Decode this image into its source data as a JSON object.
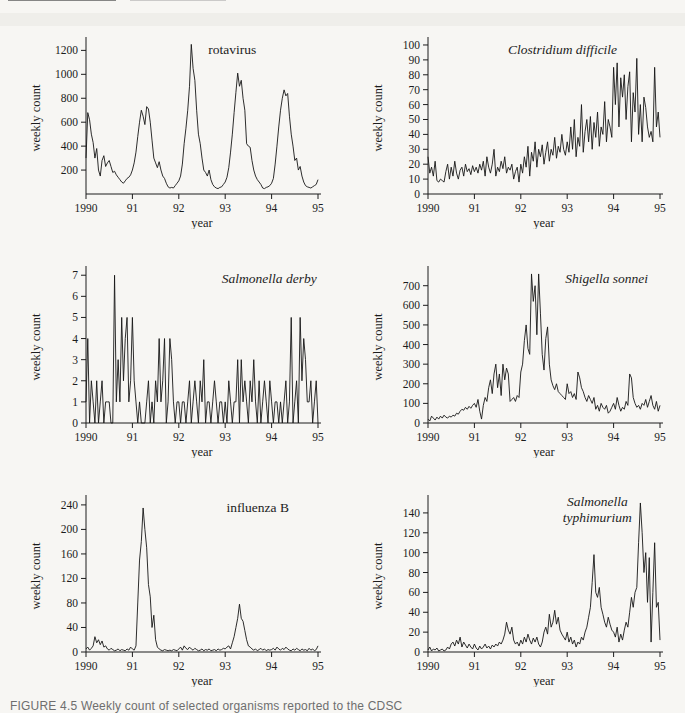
{
  "page": {
    "caption": "FIGURE 4.5  Weekly count of selected organisms reported to the CDSC"
  },
  "chart_data": [
    {
      "type": "line",
      "title": "rotavirus",
      "title_lines": [
        "rotavirus"
      ],
      "title_italic": false,
      "title_x": 0.63,
      "xlabel": "year",
      "ylabel": "weekly count",
      "x_tick_labels": [
        "1990",
        "91",
        "92",
        "93",
        "94",
        "95"
      ],
      "xlim": [
        1990,
        1995
      ],
      "y_ticks": [
        200,
        400,
        600,
        800,
        1000,
        1200
      ],
      "ylim": [
        0,
        1270
      ],
      "values": [
        300,
        680,
        620,
        500,
        430,
        300,
        380,
        200,
        150,
        280,
        320,
        230,
        260,
        280,
        230,
        180,
        190,
        160,
        140,
        120,
        100,
        90,
        110,
        130,
        140,
        160,
        200,
        260,
        350,
        480,
        600,
        700,
        650,
        580,
        730,
        710,
        600,
        450,
        300,
        260,
        220,
        270,
        200,
        150,
        130,
        90,
        60,
        50,
        55,
        50,
        70,
        90,
        110,
        150,
        250,
        420,
        550,
        700,
        900,
        1250,
        1050,
        950,
        700,
        500,
        420,
        300,
        200,
        180,
        150,
        200,
        120,
        80,
        60,
        50,
        45,
        55,
        60,
        80,
        100,
        140,
        220,
        350,
        500,
        680,
        850,
        1010,
        900,
        950,
        800,
        700,
        420,
        400,
        390,
        280,
        200,
        150,
        120,
        100,
        80,
        50,
        45,
        55,
        60,
        70,
        90,
        130,
        250,
        400,
        560,
        700,
        800,
        870,
        820,
        840,
        650,
        500,
        400,
        280,
        300,
        200,
        230,
        150,
        100,
        70,
        60,
        55,
        50,
        60,
        70,
        80,
        120
      ]
    },
    {
      "type": "line",
      "title": "Clostridium difficile",
      "title_lines": [
        "Clostridium difficile"
      ],
      "title_italic": true,
      "title_x": 0.58,
      "xlabel": "year",
      "ylabel": "weekly count",
      "x_tick_labels": [
        "1990",
        "91",
        "92",
        "93",
        "94",
        "95"
      ],
      "xlim": [
        1990,
        1995
      ],
      "y_ticks": [
        0,
        10,
        20,
        30,
        40,
        50,
        60,
        70,
        80,
        90,
        100
      ],
      "ylim": [
        0,
        102
      ],
      "values": [
        25,
        14,
        18,
        12,
        22,
        9,
        8,
        10,
        9,
        8,
        15,
        20,
        10,
        18,
        12,
        22,
        14,
        10,
        16,
        18,
        12,
        20,
        15,
        17,
        13,
        19,
        15,
        18,
        14,
        20,
        16,
        22,
        12,
        25,
        18,
        14,
        20,
        30,
        12,
        18,
        15,
        22,
        17,
        25,
        14,
        18,
        16,
        20,
        10,
        15,
        18,
        8,
        20,
        14,
        25,
        18,
        32,
        12,
        28,
        22,
        35,
        18,
        30,
        25,
        33,
        20,
        28,
        35,
        22,
        30,
        26,
        38,
        24,
        32,
        28,
        40,
        30,
        26,
        35,
        28,
        45,
        30,
        50,
        25,
        38,
        32,
        60,
        28,
        42,
        50,
        35,
        52,
        30,
        48,
        38,
        55,
        32,
        45,
        40,
        62,
        35,
        50,
        45,
        38,
        85,
        60,
        88,
        45,
        78,
        65,
        80,
        50,
        72,
        82,
        35,
        68,
        55,
        91,
        40,
        60,
        35,
        65,
        58,
        45,
        38,
        42,
        35,
        85,
        45,
        55,
        38
      ]
    },
    {
      "type": "line",
      "title": "Salmonella derby",
      "title_lines": [
        "Salmonella derby"
      ],
      "title_italic": true,
      "title_x": 0.79,
      "xlabel": "year",
      "ylabel": "weekly count",
      "x_tick_labels": [
        "1990",
        "91",
        "92",
        "93",
        "94",
        "95"
      ],
      "xlim": [
        1990,
        1995
      ],
      "y_ticks": [
        0,
        1,
        2,
        3,
        4,
        5,
        6,
        7
      ],
      "ylim": [
        0,
        7.2
      ],
      "values": [
        1,
        4,
        0,
        2,
        1,
        0,
        2,
        0,
        1,
        2,
        0,
        1,
        1,
        1,
        0,
        0,
        7,
        1,
        3,
        1,
        5,
        2,
        4,
        5,
        1,
        2,
        5,
        2,
        1,
        0,
        1,
        0,
        0,
        0,
        1,
        2,
        0,
        1,
        0,
        2,
        1,
        4,
        1,
        2,
        4,
        0,
        1,
        4,
        3,
        1,
        0,
        1,
        1,
        0,
        1,
        1,
        0,
        1,
        2,
        0,
        1,
        2,
        1,
        0,
        2,
        1,
        3,
        0,
        1,
        1,
        0,
        1,
        2,
        1,
        0,
        1,
        1,
        0,
        1,
        0,
        2,
        1,
        0,
        1,
        1,
        3,
        0,
        3,
        1,
        2,
        1,
        0,
        2,
        1,
        3,
        1,
        0,
        2,
        0,
        1,
        2,
        1,
        0,
        2,
        1,
        0,
        1,
        1,
        0,
        1,
        0,
        1,
        2,
        0,
        1,
        5,
        0,
        1,
        2,
        0,
        5,
        2,
        4,
        3,
        1,
        1,
        2,
        0,
        1,
        2,
        0
      ]
    },
    {
      "type": "line",
      "title": "Shigella sonnei",
      "title_lines": [
        "Shigella sonnei"
      ],
      "title_italic": true,
      "title_x": 0.77,
      "xlabel": "year",
      "ylabel": "weekly count",
      "x_tick_labels": [
        "1990",
        "91",
        "92",
        "93",
        "94",
        "95"
      ],
      "xlim": [
        1990,
        1995
      ],
      "y_ticks": [
        0,
        100,
        200,
        300,
        400,
        500,
        600,
        700
      ],
      "ylim": [
        0,
        775
      ],
      "values": [
        20,
        10,
        35,
        25,
        15,
        30,
        20,
        35,
        25,
        40,
        30,
        25,
        35,
        30,
        40,
        35,
        50,
        45,
        60,
        70,
        65,
        80,
        70,
        85,
        75,
        90,
        100,
        80,
        120,
        60,
        20,
        90,
        130,
        110,
        180,
        220,
        150,
        250,
        300,
        180,
        250,
        140,
        300,
        220,
        280,
        250,
        110,
        120,
        130,
        110,
        140,
        130,
        260,
        300,
        420,
        500,
        380,
        350,
        760,
        620,
        700,
        450,
        760,
        560,
        350,
        270,
        430,
        490,
        300,
        220,
        190,
        170,
        200,
        160,
        150,
        140,
        130,
        120,
        200,
        150,
        160,
        130,
        150,
        120,
        260,
        230,
        180,
        160,
        130,
        110,
        140,
        120,
        100,
        130,
        70,
        90,
        60,
        100,
        80,
        70,
        90,
        50,
        60,
        80,
        100,
        70,
        130,
        90,
        60,
        80,
        70,
        110,
        90,
        250,
        230,
        130,
        100,
        80,
        90,
        70,
        100,
        90,
        120,
        80,
        110,
        140,
        90,
        70,
        110,
        60,
        90
      ]
    },
    {
      "type": "line",
      "title": "influenza B",
      "title_lines": [
        "influenza B"
      ],
      "title_italic": false,
      "title_x": 0.74,
      "xlabel": "year",
      "ylabel": "weekly count",
      "x_tick_labels": [
        "1990",
        "91",
        "92",
        "93",
        "94",
        "95"
      ],
      "xlim": [
        1990,
        1995
      ],
      "y_ticks": [
        0,
        40,
        80,
        120,
        160,
        200,
        240
      ],
      "ylim": [
        0,
        248
      ],
      "values": [
        5,
        8,
        3,
        6,
        10,
        25,
        15,
        20,
        12,
        18,
        8,
        10,
        5,
        3,
        6,
        4,
        2,
        3,
        5,
        2,
        4,
        3,
        2,
        5,
        3,
        8,
        5,
        3,
        10,
        80,
        150,
        180,
        235,
        200,
        170,
        110,
        90,
        40,
        60,
        20,
        8,
        5,
        3,
        2,
        4,
        3,
        2,
        3,
        2,
        4,
        3,
        2,
        5,
        8,
        3,
        10,
        6,
        4,
        8,
        5,
        3,
        6,
        4,
        2,
        3,
        5,
        2,
        4,
        3,
        5,
        2,
        3,
        4,
        2,
        5,
        3,
        4,
        6,
        5,
        8,
        10,
        5,
        15,
        25,
        40,
        55,
        78,
        55,
        50,
        35,
        20,
        10,
        8,
        5,
        3,
        5,
        2,
        4,
        6,
        3,
        5,
        2,
        4,
        3,
        4,
        6,
        3,
        8,
        5,
        3,
        6,
        4,
        8,
        5,
        3,
        2,
        5,
        3,
        6,
        4,
        2,
        5,
        3,
        4,
        2,
        6,
        3,
        5,
        2,
        4,
        10
      ]
    },
    {
      "type": "line",
      "title": "Salmonella typhimurium",
      "title_lines": [
        "Salmonella",
        "typhimurium"
      ],
      "title_italic": true,
      "title_x": 0.73,
      "xlabel": "year",
      "ylabel": "weekly count",
      "x_tick_labels": [
        "1990",
        "91",
        "92",
        "93",
        "94",
        "95"
      ],
      "xlim": [
        1990,
        1995
      ],
      "y_ticks": [
        0,
        20,
        40,
        60,
        80,
        100,
        120,
        140
      ],
      "ylim": [
        0,
        153
      ],
      "values": [
        2,
        5,
        1,
        3,
        2,
        4,
        1,
        2,
        3,
        1,
        2,
        5,
        3,
        8,
        10,
        6,
        12,
        8,
        15,
        5,
        10,
        7,
        4,
        8,
        5,
        3,
        8,
        4,
        2,
        6,
        3,
        5,
        8,
        4,
        6,
        3,
        7,
        5,
        8,
        6,
        10,
        8,
        12,
        18,
        30,
        22,
        18,
        25,
        12,
        8,
        10,
        6,
        12,
        8,
        15,
        10,
        18,
        12,
        8,
        14,
        10,
        15,
        8,
        5,
        10,
        20,
        25,
        18,
        38,
        25,
        30,
        42,
        28,
        35,
        22,
        18,
        15,
        12,
        20,
        10,
        15,
        8,
        12,
        5,
        10,
        8,
        15,
        12,
        20,
        25,
        35,
        45,
        70,
        98,
        60,
        55,
        65,
        45,
        38,
        30,
        25,
        35,
        28,
        22,
        20,
        15,
        25,
        10,
        18,
        12,
        22,
        30,
        25,
        40,
        55,
        45,
        60,
        65,
        110,
        150,
        120,
        80,
        100,
        50,
        95,
        10,
        60,
        110,
        45,
        50,
        12
      ]
    }
  ]
}
